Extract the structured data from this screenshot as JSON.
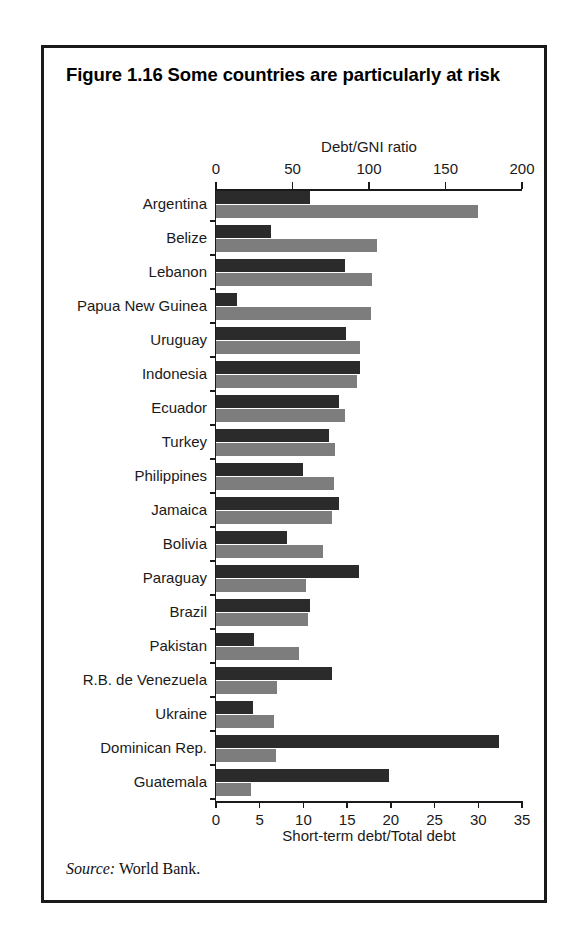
{
  "figure": {
    "title": "Figure 1.16  Some countries are particularly at risk",
    "source_label": "Source:",
    "source_text": " World Bank."
  },
  "colors": {
    "dark_series": "#2b2b2b",
    "gray_series": "#7d7d7d",
    "frame": "#1a1a1a",
    "background": "#ffffff"
  },
  "chart_data": {
    "type": "bar",
    "orientation": "horizontal",
    "title": "Figure 1.16  Some countries are particularly at risk",
    "grid": false,
    "legend": null,
    "source": "Source: World Bank.",
    "categories": [
      "Argentina",
      "Belize",
      "Lebanon",
      "Papua New Guinea",
      "Uruguay",
      "Indonesia",
      "Ecuador",
      "Turkey",
      "Philippines",
      "Jamaica",
      "Bolivia",
      "Paraguay",
      "Brazil",
      "Pakistan",
      "R.B. de Venezuela",
      "Ukraine",
      "Dominican Rep.",
      "Guatemala"
    ],
    "axes": {
      "top": {
        "label": "Debt/GNI ratio",
        "ticks": [
          0,
          50,
          100,
          150,
          200
        ],
        "lim": [
          0,
          200
        ],
        "series": "gray_series"
      },
      "bottom": {
        "label": "Short-term debt/Total debt",
        "ticks": [
          0,
          5,
          10,
          15,
          20,
          25,
          30,
          35
        ],
        "lim": [
          0,
          35
        ],
        "series": "dark_series"
      }
    },
    "series": [
      {
        "name": "Short-term debt/Total debt",
        "axis": "bottom",
        "color": "#2b2b2b",
        "values": [
          10.8,
          6.3,
          14.8,
          2.4,
          14.9,
          16.5,
          14.1,
          12.9,
          9.9,
          14.1,
          8.1,
          16.3,
          10.8,
          4.4,
          13.3,
          4.2,
          32.4,
          19.8
        ]
      },
      {
        "name": "Debt/GNI ratio",
        "axis": "top",
        "color": "#7d7d7d",
        "values": [
          171,
          105,
          102,
          101,
          94,
          92,
          84,
          78,
          77,
          76,
          70,
          59,
          60,
          54,
          40,
          38,
          39,
          23
        ]
      }
    ]
  }
}
